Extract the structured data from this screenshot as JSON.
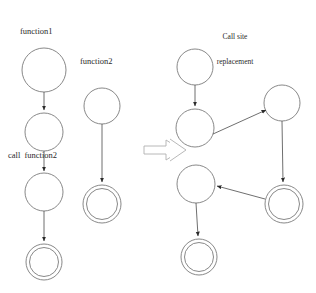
{
  "figure": {
    "kind": "state-machine-transformation-diagram",
    "title": "Call site replacement",
    "title_line1": "Call site",
    "title_line2": "replacement",
    "transform_symbol": "double-right-arrow"
  },
  "labels": {
    "function1": "function1",
    "function2": "function2",
    "call_function2": "call  function2"
  },
  "colors": {
    "background": "#ffffff",
    "node_stroke": "#7a7a7a",
    "edge_stroke": "#4a4a4a",
    "text": "#2a2a2a",
    "implies_stroke": "#b0b0b0"
  },
  "before": {
    "graphs": [
      {
        "name": "function1",
        "nodes": [
          {
            "id": "f1_entry",
            "type": "state",
            "cx": 44,
            "cy": 70,
            "r": 22
          },
          {
            "id": "f1_callsite",
            "type": "state",
            "cx": 44,
            "cy": 132,
            "r": 19
          },
          {
            "id": "f1_after_call",
            "type": "state",
            "cx": 44,
            "cy": 192,
            "r": 19
          },
          {
            "id": "f1_accept",
            "type": "accepting-state",
            "cx": 44,
            "cy": 262,
            "r": 18
          }
        ],
        "edges": [
          {
            "from": "f1_entry",
            "to": "f1_callsite",
            "label": ""
          },
          {
            "from": "f1_callsite",
            "to": "f1_after_call",
            "label": "call  function2"
          },
          {
            "from": "f1_after_call",
            "to": "f1_accept",
            "label": ""
          }
        ]
      },
      {
        "name": "function2",
        "nodes": [
          {
            "id": "f2_entry",
            "type": "state",
            "cx": 102,
            "cy": 106,
            "r": 18
          },
          {
            "id": "f2_accept",
            "type": "accepting-state",
            "cx": 102,
            "cy": 204,
            "r": 19
          }
        ],
        "edges": [
          {
            "from": "f2_entry",
            "to": "f2_accept",
            "label": ""
          }
        ]
      }
    ]
  },
  "after": {
    "graph": {
      "name": "Call site replacement",
      "nodes": [
        {
          "id": "r_entry",
          "type": "state",
          "cx": 195,
          "cy": 67,
          "r": 18
        },
        {
          "id": "r_callsite",
          "type": "state",
          "cx": 195,
          "cy": 128,
          "r": 19
        },
        {
          "id": "r_f2_entry",
          "type": "state",
          "cx": 282,
          "cy": 103,
          "r": 18
        },
        {
          "id": "r_f2_accept",
          "type": "accepting-state",
          "cx": 284,
          "cy": 204,
          "r": 19
        },
        {
          "id": "r_after_call",
          "type": "state",
          "cx": 196,
          "cy": 184,
          "r": 19
        },
        {
          "id": "r_accept",
          "type": "accepting-state",
          "cx": 199,
          "cy": 257,
          "r": 18
        }
      ],
      "edges": [
        {
          "from": "r_entry",
          "to": "r_callsite",
          "label": ""
        },
        {
          "from": "r_callsite",
          "to": "r_f2_entry",
          "label": ""
        },
        {
          "from": "r_f2_entry",
          "to": "r_f2_accept",
          "label": ""
        },
        {
          "from": "r_f2_accept",
          "to": "r_after_call",
          "label": ""
        },
        {
          "from": "r_after_call",
          "to": "r_accept",
          "label": ""
        }
      ]
    }
  }
}
